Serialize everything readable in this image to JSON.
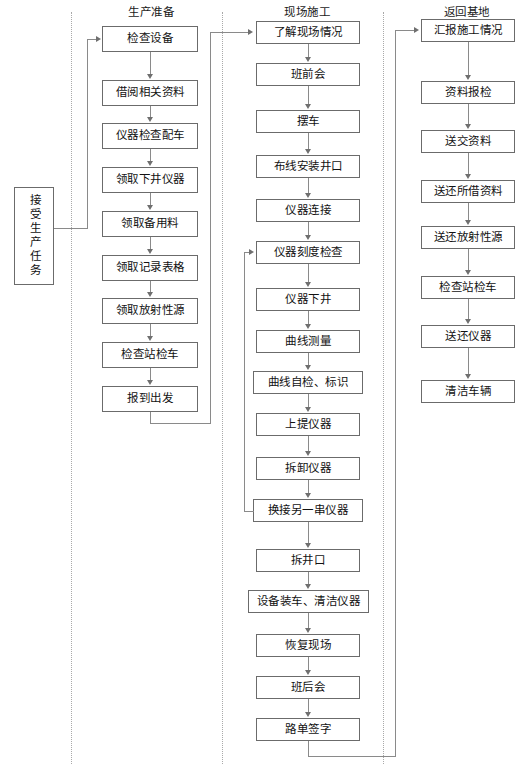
{
  "diagram": {
    "entry_node": "接受生产任务",
    "columns": [
      {
        "id": "production-preparation",
        "title": "生产准备",
        "nodes": [
          "检查设备",
          "借阅相关资料",
          "仪器检查配车",
          "领取下井仪器",
          "领取备用料",
          "领取记录表格",
          "领取放射性源",
          "检查站检车",
          "报到出发"
        ]
      },
      {
        "id": "site-construction",
        "title": "现场施工",
        "nodes": [
          "了解现场情况",
          "班前会",
          "摆车",
          "布线安装井口",
          "仪器连接",
          "仪器刻度检查",
          "仪器下井",
          "曲线测量",
          "曲线自检、标识",
          "上提仪器",
          "拆卸仪器",
          "换接另一串仪器",
          "拆井口",
          "设备装车、清洁仪器",
          "恢复现场",
          "班后会",
          "路单签字"
        ]
      },
      {
        "id": "return-to-base",
        "title": "返回基地",
        "nodes": [
          "汇报施工情况",
          "资料报检",
          "送交资料",
          "送还所借资料",
          "送还放射性源",
          "检查站检车",
          "送还仪器",
          "清洁车辆"
        ]
      }
    ],
    "feedback_loop": {
      "from": "换接另一串仪器",
      "to": "仪器刻度检查"
    },
    "colors": {
      "box_border": "#6b6b6b",
      "connector": "#8a8a8a",
      "divider": "#a9a9a9",
      "text": "#121212",
      "background": "#ffffff"
    }
  }
}
